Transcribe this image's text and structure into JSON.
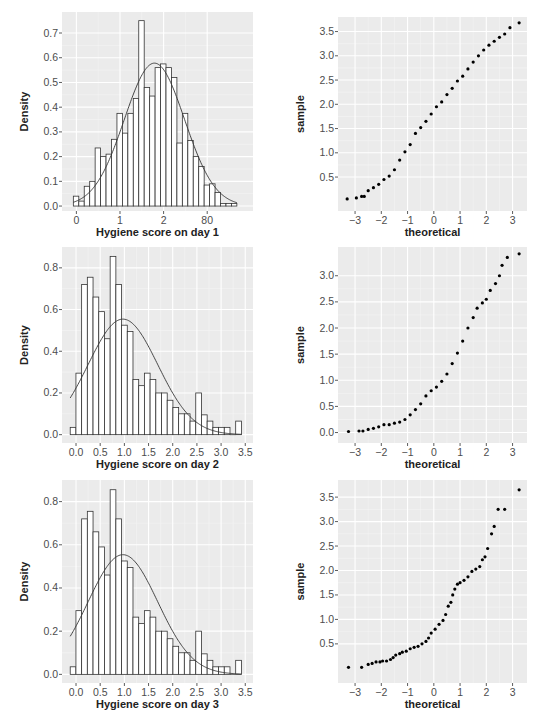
{
  "chart_data": [
    {
      "id": "hist_day1",
      "type": "bar",
      "subtype": "histogram_with_normal_curve",
      "title": "",
      "xlabel": "Hygiene score on day 1",
      "ylabel": "Density",
      "x_ticks": [
        {
          "v": 0,
          "label": "0"
        },
        {
          "v": 1,
          "label": "1"
        },
        {
          "v": 2,
          "label": "2"
        },
        {
          "v": 3,
          "label": "80"
        }
      ],
      "y_ticks": [
        0.0,
        0.1,
        0.2,
        0.3,
        0.4,
        0.5,
        0.6,
        0.7
      ],
      "y_tick_labels": [
        "0.0",
        "0.1",
        "0.2",
        "0.3",
        "0.4",
        "0.5",
        "0.6",
        "0.7"
      ],
      "xlim": [
        -0.33,
        4.05
      ],
      "ylim": [
        -0.02,
        0.785
      ],
      "bin_start": -0.07,
      "bin_width": 0.125,
      "values": [
        0.04,
        0.02,
        0.08,
        0.1,
        0.235,
        0.2,
        0.21,
        0.27,
        0.375,
        0.295,
        0.375,
        0.435,
        0.75,
        0.48,
        0.445,
        0.56,
        0.575,
        0.56,
        0.52,
        0.255,
        0.375,
        0.265,
        0.2,
        0.16,
        0.085,
        0.09,
        0.055,
        0.01,
        0.01,
        0.01
      ],
      "curve": {
        "mean": 1.79,
        "sd": 0.69
      },
      "grid": true,
      "background": "#ebebeb"
    },
    {
      "id": "qq_day1",
      "type": "scatter",
      "subtype": "qq_plot",
      "xlabel": "theoretical",
      "ylabel": "sample",
      "x_ticks": [
        -3,
        -2,
        -1,
        0,
        1,
        2,
        3
      ],
      "x_tick_labels": [
        "−3",
        "−2",
        "−1",
        "0",
        "1",
        "2",
        "3"
      ],
      "y_ticks": [
        0.5,
        1.0,
        1.5,
        2.0,
        2.5,
        3.0,
        3.5
      ],
      "y_tick_labels": [
        "0.5",
        "1.0",
        "1.5",
        "2.0",
        "2.5",
        "3.0",
        "3.5"
      ],
      "xlim": [
        -3.65,
        3.55
      ],
      "ylim": [
        -0.2,
        3.8
      ],
      "points": [
        [
          -3.3,
          0.05
        ],
        [
          -2.95,
          0.07
        ],
        [
          -2.75,
          0.1
        ],
        [
          -2.65,
          0.1
        ],
        [
          -2.5,
          0.22
        ],
        [
          -2.3,
          0.28
        ],
        [
          -2.1,
          0.35
        ],
        [
          -1.9,
          0.45
        ],
        [
          -1.7,
          0.52
        ],
        [
          -1.5,
          0.65
        ],
        [
          -1.3,
          0.85
        ],
        [
          -1.1,
          1.02
        ],
        [
          -0.9,
          1.17
        ],
        [
          -0.7,
          1.4
        ],
        [
          -0.5,
          1.52
        ],
        [
          -0.3,
          1.65
        ],
        [
          -0.1,
          1.8
        ],
        [
          0.1,
          1.95
        ],
        [
          0.3,
          2.05
        ],
        [
          0.5,
          2.2
        ],
        [
          0.7,
          2.33
        ],
        [
          0.9,
          2.48
        ],
        [
          1.1,
          2.58
        ],
        [
          1.3,
          2.73
        ],
        [
          1.5,
          2.87
        ],
        [
          1.7,
          3.0
        ],
        [
          1.9,
          3.12
        ],
        [
          2.1,
          3.22
        ],
        [
          2.3,
          3.3
        ],
        [
          2.5,
          3.38
        ],
        [
          2.7,
          3.45
        ],
        [
          2.9,
          3.58
        ],
        [
          3.25,
          3.68
        ]
      ],
      "grid": true,
      "background": "#ebebeb"
    },
    {
      "id": "hist_day2",
      "type": "bar",
      "subtype": "histogram_with_normal_curve",
      "xlabel": "Hygiene score on day 2",
      "ylabel": "Density",
      "x_ticks": [
        {
          "v": 0,
          "label": "0.0"
        },
        {
          "v": 0.5,
          "label": "0.5"
        },
        {
          "v": 1,
          "label": "1.0"
        },
        {
          "v": 1.5,
          "label": "1.5"
        },
        {
          "v": 2,
          "label": "2.0"
        },
        {
          "v": 2.5,
          "label": "2.5"
        },
        {
          "v": 3,
          "label": "3.0"
        },
        {
          "v": 3.5,
          "label": "3.5"
        }
      ],
      "y_ticks": [
        0.0,
        0.2,
        0.4,
        0.6,
        0.8
      ],
      "y_tick_labels": [
        "0.0",
        "0.2",
        "0.4",
        "0.6",
        "0.8"
      ],
      "xlim": [
        -0.29,
        3.66
      ],
      "ylim": [
        -0.04,
        0.9
      ],
      "bin_start": -0.12,
      "bin_width": 0.118,
      "values": [
        0.035,
        0.295,
        0.72,
        0.755,
        0.66,
        0.59,
        0.46,
        0.855,
        0.72,
        0.525,
        0.495,
        0.265,
        0.235,
        0.295,
        0.265,
        0.2,
        0.2,
        0.165,
        0.13,
        0.1,
        0.1,
        0.065,
        0.2,
        0.095,
        0.065,
        0.035,
        0.035,
        0.035,
        0.0,
        0.065
      ],
      "curve": {
        "mean": 0.97,
        "sd": 0.72
      },
      "grid": true,
      "background": "#ebebeb"
    },
    {
      "id": "qq_day2",
      "type": "scatter",
      "subtype": "qq_plot",
      "xlabel": "theoretical",
      "ylabel": "sample",
      "x_ticks": [
        -3,
        -2,
        -1,
        0,
        1,
        2,
        3
      ],
      "x_tick_labels": [
        "−3",
        "−2",
        "−1",
        "0",
        "1",
        "2",
        "3"
      ],
      "y_ticks": [
        0.0,
        0.5,
        1.0,
        1.5,
        2.0,
        2.5,
        3.0
      ],
      "y_tick_labels": [
        "0.0",
        "0.5",
        "1.0",
        "1.5",
        "2.0",
        "2.5",
        "3.0"
      ],
      "xlim": [
        -3.65,
        3.55
      ],
      "ylim": [
        -0.2,
        3.55
      ],
      "points": [
        [
          -3.25,
          0.02
        ],
        [
          -2.85,
          0.03
        ],
        [
          -2.7,
          0.03
        ],
        [
          -2.5,
          0.06
        ],
        [
          -2.3,
          0.08
        ],
        [
          -2.1,
          0.11
        ],
        [
          -1.9,
          0.15
        ],
        [
          -1.7,
          0.15
        ],
        [
          -1.5,
          0.18
        ],
        [
          -1.3,
          0.2
        ],
        [
          -1.1,
          0.25
        ],
        [
          -0.9,
          0.34
        ],
        [
          -0.7,
          0.44
        ],
        [
          -0.5,
          0.55
        ],
        [
          -0.3,
          0.7
        ],
        [
          -0.1,
          0.8
        ],
        [
          0.1,
          0.87
        ],
        [
          0.3,
          0.98
        ],
        [
          0.5,
          1.12
        ],
        [
          0.7,
          1.32
        ],
        [
          0.9,
          1.52
        ],
        [
          1.1,
          1.75
        ],
        [
          1.3,
          2.0
        ],
        [
          1.5,
          2.2
        ],
        [
          1.65,
          2.38
        ],
        [
          1.85,
          2.48
        ],
        [
          2.0,
          2.55
        ],
        [
          2.15,
          2.72
        ],
        [
          2.35,
          2.85
        ],
        [
          2.5,
          3.0
        ],
        [
          2.6,
          3.2
        ],
        [
          2.8,
          3.35
        ],
        [
          3.25,
          3.42
        ]
      ],
      "grid": true,
      "background": "#ebebeb"
    },
    {
      "id": "hist_day3",
      "type": "bar",
      "subtype": "histogram_with_normal_curve",
      "xlabel": "Hygiene score on day 3",
      "ylabel": "Density",
      "x_ticks": [
        {
          "v": 0,
          "label": "0.0"
        },
        {
          "v": 0.5,
          "label": "0.5"
        },
        {
          "v": 1,
          "label": "1.0"
        },
        {
          "v": 1.5,
          "label": "1.5"
        },
        {
          "v": 2,
          "label": "2.0"
        },
        {
          "v": 2.5,
          "label": "2.5"
        },
        {
          "v": 3,
          "label": "3.0"
        },
        {
          "v": 3.5,
          "label": "3.5"
        }
      ],
      "y_ticks": [
        0.0,
        0.2,
        0.4,
        0.6,
        0.8
      ],
      "y_tick_labels": [
        "0.0",
        "0.2",
        "0.4",
        "0.6",
        "0.8"
      ],
      "xlim": [
        -0.29,
        3.66
      ],
      "ylim": [
        -0.04,
        0.9
      ],
      "bin_start": -0.12,
      "bin_width": 0.118,
      "values": [
        0.035,
        0.295,
        0.72,
        0.755,
        0.66,
        0.59,
        0.46,
        0.855,
        0.72,
        0.525,
        0.495,
        0.265,
        0.235,
        0.295,
        0.265,
        0.2,
        0.2,
        0.165,
        0.13,
        0.1,
        0.1,
        0.065,
        0.2,
        0.095,
        0.065,
        0.035,
        0.035,
        0.035,
        0.0,
        0.065
      ],
      "curve": {
        "mean": 0.97,
        "sd": 0.72
      },
      "grid": true,
      "background": "#ebebeb"
    },
    {
      "id": "qq_day3",
      "type": "scatter",
      "subtype": "qq_plot",
      "xlabel": "theoretical",
      "ylabel": "sample",
      "x_ticks": [
        -3,
        -2,
        -1,
        0,
        1,
        2,
        3
      ],
      "x_tick_labels": [
        "−3",
        "−2",
        "−1",
        "0",
        "1",
        "2",
        "3"
      ],
      "y_ticks": [
        0.5,
        1.0,
        1.5,
        2.0,
        2.5,
        3.0,
        3.5
      ],
      "y_tick_labels": [
        "0.5",
        "1.0",
        "1.5",
        "2.0",
        "2.5",
        "3.0",
        "3.5"
      ],
      "xlim": [
        -3.65,
        3.55
      ],
      "ylim": [
        -0.3,
        3.85
      ],
      "points": [
        [
          -3.25,
          0.02
        ],
        [
          -2.75,
          0.02
        ],
        [
          -2.5,
          0.08
        ],
        [
          -2.35,
          0.1
        ],
        [
          -2.2,
          0.13
        ],
        [
          -2.05,
          0.13
        ],
        [
          -1.95,
          0.15
        ],
        [
          -1.8,
          0.15
        ],
        [
          -1.65,
          0.18
        ],
        [
          -1.55,
          0.22
        ],
        [
          -1.45,
          0.27
        ],
        [
          -1.3,
          0.3
        ],
        [
          -1.2,
          0.33
        ],
        [
          -1.05,
          0.35
        ],
        [
          -0.9,
          0.4
        ],
        [
          -0.75,
          0.43
        ],
        [
          -0.6,
          0.45
        ],
        [
          -0.45,
          0.5
        ],
        [
          -0.3,
          0.55
        ],
        [
          -0.2,
          0.62
        ],
        [
          -0.1,
          0.72
        ],
        [
          0.05,
          0.8
        ],
        [
          0.2,
          0.9
        ],
        [
          0.35,
          0.98
        ],
        [
          0.45,
          1.1
        ],
        [
          0.55,
          1.27
        ],
        [
          0.65,
          1.35
        ],
        [
          0.72,
          1.5
        ],
        [
          0.8,
          1.62
        ],
        [
          0.9,
          1.72
        ],
        [
          1.0,
          1.75
        ],
        [
          1.15,
          1.8
        ],
        [
          1.3,
          1.87
        ],
        [
          1.45,
          1.98
        ],
        [
          1.6,
          2.03
        ],
        [
          1.75,
          2.08
        ],
        [
          1.85,
          2.22
        ],
        [
          1.95,
          2.28
        ],
        [
          2.05,
          2.45
        ],
        [
          2.2,
          2.75
        ],
        [
          2.3,
          2.9
        ],
        [
          2.45,
          3.25
        ],
        [
          2.7,
          3.25
        ],
        [
          3.25,
          3.65
        ]
      ],
      "grid": true,
      "background": "#ebebeb"
    }
  ],
  "layout": {
    "panels": [
      {
        "id": "hist_day1",
        "x": 62,
        "y": 12,
        "w": 191,
        "h": 199
      },
      {
        "id": "qq_day1",
        "x": 338,
        "y": 17,
        "w": 189,
        "h": 194
      },
      {
        "id": "hist_day2",
        "x": 62,
        "y": 247,
        "w": 191,
        "h": 196
      },
      {
        "id": "qq_day2",
        "x": 338,
        "y": 247,
        "w": 189,
        "h": 196
      },
      {
        "id": "hist_day3",
        "x": 62,
        "y": 480,
        "w": 191,
        "h": 203
      },
      {
        "id": "qq_day3",
        "x": 338,
        "y": 480,
        "w": 189,
        "h": 203
      }
    ]
  }
}
